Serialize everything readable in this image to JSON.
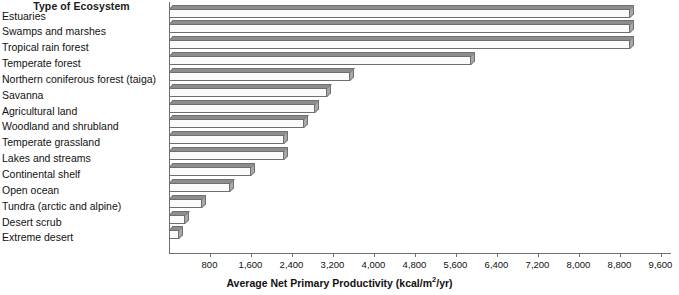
{
  "chart_data": {
    "type": "bar",
    "orientation": "horizontal",
    "title": "",
    "category_axis_title": "Type of Ecosystem",
    "xlabel": "Average Net Primary Productivity (kcal/m²/yr)",
    "ylabel": "",
    "xlim": [
      0,
      9600
    ],
    "xticks": [
      800,
      1600,
      2400,
      3200,
      4000,
      4800,
      5600,
      6400,
      7200,
      8000,
      8800,
      9600
    ],
    "xtick_labels": [
      "800",
      "1,600",
      "2,400",
      "3,200",
      "4,000",
      "4,800",
      "5,600",
      "6,400",
      "7,200",
      "8,000",
      "8,800",
      "9,600"
    ],
    "grid": false,
    "legend": null,
    "units": "kcal/m²/yr",
    "categories": [
      "Estuaries",
      "Swamps and marshes",
      "Tropical rain forest",
      "Temperate forest",
      "Northern coniferous forest (taiga)",
      "Savanna",
      "Agricultural land",
      "Woodland and shrubland",
      "Temperate grassland",
      "Lakes and streams",
      "Continental shelf",
      "Open ocean",
      "Tundra (arctic and alpine)",
      "Desert scrub",
      "Extreme desert"
    ],
    "values": [
      9000,
      9000,
      9000,
      5900,
      3550,
      3100,
      2850,
      2650,
      2250,
      2250,
      1600,
      1200,
      650,
      330,
      200
    ]
  },
  "style": {
    "bar_face_color": "#fbfbfb",
    "bar_top_color": "#8d8d8d",
    "bar_cap_color": "#a8a8a8",
    "bar_edge_color": "#6f6f6f",
    "axis_color": "#6f6f6f",
    "text_color": "#111111",
    "background": "#ffffff"
  }
}
